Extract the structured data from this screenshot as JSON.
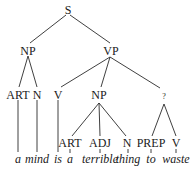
{
  "diagram": {
    "type": "parse-tree",
    "nodes": {
      "s": "S",
      "np": "NP",
      "vp": "VP",
      "art1": "ART",
      "n1": "N",
      "v1": "V",
      "np2": "NP",
      "q": "?",
      "art2": "ART",
      "adj": "ADJ",
      "n2": "N",
      "prep": "PREP",
      "v2": "V"
    },
    "words": [
      "a",
      "mind",
      "is",
      "a",
      "terrible",
      "thing",
      "to",
      "waste"
    ],
    "sentence": "a mind is a terrible thing to waste",
    "edges": [
      [
        "S",
        "NP"
      ],
      [
        "S",
        "VP"
      ],
      [
        "NP",
        "ART"
      ],
      [
        "NP",
        "N"
      ],
      [
        "VP",
        "V"
      ],
      [
        "VP",
        "NP"
      ],
      [
        "VP",
        "?"
      ],
      [
        "NP",
        "ART"
      ],
      [
        "NP",
        "ADJ"
      ],
      [
        "NP",
        "N"
      ],
      [
        "?",
        "PREP"
      ],
      [
        "?",
        "V"
      ]
    ]
  }
}
